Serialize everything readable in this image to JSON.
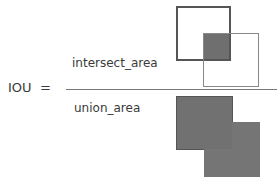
{
  "formula": {
    "lhs": "IOU",
    "equals": "=",
    "numerator": "intersect_area",
    "denominator": "union_area"
  },
  "figures": {
    "numerator_figure": "two-overlapping-boxes-with-shaded-intersection",
    "denominator_figure": "union-of-two-boxes-shaded"
  },
  "colors": {
    "fill": "#6f6f6f",
    "outline_dark": "#555555",
    "outline_light": "#888888",
    "background": "#ffffff"
  }
}
